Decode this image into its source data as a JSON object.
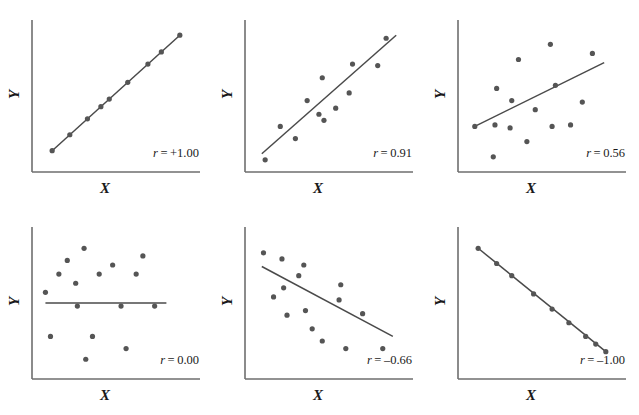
{
  "figure": {
    "title": "",
    "panel_width": 213,
    "panel_height": 207,
    "columns": 3,
    "rows": 2,
    "axis_color": "#6e6e6e",
    "point_color": "#555555",
    "line_color": "#4a4a4a",
    "background": "#ffffff"
  },
  "labels": {
    "x": "X",
    "y": "Y",
    "r_symbol": "r",
    "equals": "="
  },
  "chart_data": [
    {
      "type": "scatter",
      "title": "",
      "xlabel": "X",
      "ylabel": "Y",
      "annotation": "r = +1.00",
      "r_value": 1.0,
      "r_text": "+1.00",
      "xlim": [
        0,
        100
      ],
      "ylim": [
        0,
        100
      ],
      "grid": false,
      "legend": "none",
      "regression_line": {
        "x": [
          12,
          88
        ],
        "y": [
          14,
          90
        ]
      },
      "points": [
        {
          "x": 12,
          "y": 14
        },
        {
          "x": 22.5,
          "y": 24.5
        },
        {
          "x": 33,
          "y": 35
        },
        {
          "x": 41,
          "y": 43
        },
        {
          "x": 46,
          "y": 48
        },
        {
          "x": 57,
          "y": 59
        },
        {
          "x": 69,
          "y": 71
        },
        {
          "x": 77,
          "y": 79
        },
        {
          "x": 88,
          "y": 90
        }
      ]
    },
    {
      "type": "scatter",
      "title": "",
      "xlabel": "X",
      "ylabel": "Y",
      "annotation": "r = 0.91",
      "r_value": 0.91,
      "r_text": "0.91",
      "xlim": [
        0,
        100
      ],
      "ylim": [
        0,
        100
      ],
      "grid": false,
      "legend": "none",
      "regression_line": {
        "x": [
          10,
          90
        ],
        "y": [
          12,
          90
        ]
      },
      "points": [
        {
          "x": 12,
          "y": 8
        },
        {
          "x": 21,
          "y": 30
        },
        {
          "x": 30,
          "y": 22
        },
        {
          "x": 37,
          "y": 47
        },
        {
          "x": 44,
          "y": 38
        },
        {
          "x": 46,
          "y": 62
        },
        {
          "x": 54,
          "y": 42
        },
        {
          "x": 62,
          "y": 52
        },
        {
          "x": 64,
          "y": 71
        },
        {
          "x": 79,
          "y": 70
        },
        {
          "x": 84,
          "y": 88
        },
        {
          "x": 47,
          "y": 34
        }
      ]
    },
    {
      "type": "scatter",
      "title": "",
      "xlabel": "X",
      "ylabel": "Y",
      "annotation": "r = 0.56",
      "r_value": 0.56,
      "r_text": "0.56",
      "xlim": [
        0,
        100
      ],
      "ylim": [
        0,
        100
      ],
      "grid": false,
      "legend": "none",
      "regression_line": {
        "x": [
          10,
          87
        ],
        "y": [
          30,
          72
        ]
      },
      "points": [
        {
          "x": 10,
          "y": 30
        },
        {
          "x": 21,
          "y": 10
        },
        {
          "x": 22,
          "y": 31
        },
        {
          "x": 23,
          "y": 55
        },
        {
          "x": 31,
          "y": 29
        },
        {
          "x": 32,
          "y": 47
        },
        {
          "x": 36,
          "y": 74
        },
        {
          "x": 41,
          "y": 20
        },
        {
          "x": 46,
          "y": 41
        },
        {
          "x": 55,
          "y": 84
        },
        {
          "x": 56,
          "y": 30
        },
        {
          "x": 58,
          "y": 57
        },
        {
          "x": 67,
          "y": 31
        },
        {
          "x": 74,
          "y": 46
        },
        {
          "x": 80,
          "y": 78
        }
      ]
    },
    {
      "type": "scatter",
      "title": "",
      "xlabel": "X",
      "ylabel": "Y",
      "annotation": "r = 0.00",
      "r_value": 0.0,
      "r_text": "0.00",
      "xlim": [
        0,
        100
      ],
      "ylim": [
        0,
        100
      ],
      "grid": false,
      "legend": "none",
      "regression_line": {
        "x": [
          8,
          80
        ],
        "y": [
          50,
          50
        ]
      },
      "points": [
        {
          "x": 8,
          "y": 57
        },
        {
          "x": 11,
          "y": 28
        },
        {
          "x": 16,
          "y": 69
        },
        {
          "x": 21,
          "y": 78
        },
        {
          "x": 26,
          "y": 63
        },
        {
          "x": 27,
          "y": 48
        },
        {
          "x": 31,
          "y": 86
        },
        {
          "x": 32,
          "y": 13
        },
        {
          "x": 36,
          "y": 28
        },
        {
          "x": 40,
          "y": 69
        },
        {
          "x": 48,
          "y": 75
        },
        {
          "x": 53,
          "y": 48
        },
        {
          "x": 56,
          "y": 20
        },
        {
          "x": 62,
          "y": 69
        },
        {
          "x": 66,
          "y": 81
        },
        {
          "x": 73,
          "y": 48
        }
      ]
    },
    {
      "type": "scatter",
      "title": "",
      "xlabel": "X",
      "ylabel": "Y",
      "annotation": "r = –0.66",
      "r_value": -0.66,
      "r_text": "–0.66",
      "xlim": [
        0,
        100
      ],
      "ylim": [
        0,
        100
      ],
      "grid": false,
      "legend": "none",
      "regression_line": {
        "x": [
          10,
          88
        ],
        "y": [
          74,
          28
        ]
      },
      "points": [
        {
          "x": 11,
          "y": 83
        },
        {
          "x": 17,
          "y": 54
        },
        {
          "x": 22,
          "y": 79
        },
        {
          "x": 23,
          "y": 60
        },
        {
          "x": 25,
          "y": 42
        },
        {
          "x": 32,
          "y": 68
        },
        {
          "x": 35,
          "y": 75
        },
        {
          "x": 36,
          "y": 45
        },
        {
          "x": 40,
          "y": 33
        },
        {
          "x": 46,
          "y": 25
        },
        {
          "x": 56,
          "y": 52
        },
        {
          "x": 57,
          "y": 62
        },
        {
          "x": 60,
          "y": 20
        },
        {
          "x": 70,
          "y": 43
        },
        {
          "x": 82,
          "y": 20
        }
      ]
    },
    {
      "type": "scatter",
      "title": "",
      "xlabel": "X",
      "ylabel": "Y",
      "annotation": "r = –1.00",
      "r_value": -1.0,
      "r_text": "–1.00",
      "xlim": [
        0,
        100
      ],
      "ylim": [
        0,
        100
      ],
      "grid": false,
      "legend": "none",
      "regression_line": {
        "x": [
          12,
          88
        ],
        "y": [
          86,
          18
        ]
      },
      "points": [
        {
          "x": 12,
          "y": 86
        },
        {
          "x": 23,
          "y": 76
        },
        {
          "x": 32,
          "y": 68
        },
        {
          "x": 45,
          "y": 56
        },
        {
          "x": 56,
          "y": 46
        },
        {
          "x": 66,
          "y": 37
        },
        {
          "x": 76,
          "y": 28
        },
        {
          "x": 82,
          "y": 23
        },
        {
          "x": 88,
          "y": 18
        }
      ]
    }
  ]
}
